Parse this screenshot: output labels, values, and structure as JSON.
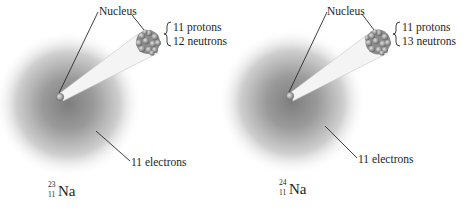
{
  "figure": {
    "atoms": [
      {
        "nucleus_label": "Nucleus",
        "protons": "11 protons",
        "neutrons": "12 neutrons",
        "electrons": "11 electrons",
        "isotope": {
          "mass_number": "23",
          "atomic_number": "11",
          "symbol": "Na"
        }
      },
      {
        "nucleus_label": "Nucleus",
        "protons": "11 protons",
        "neutrons": "13 neutrons",
        "electrons": "11 electrons",
        "isotope": {
          "mass_number": "24",
          "atomic_number": "11",
          "symbol": "Na"
        }
      }
    ],
    "colors": {
      "cloud_center": "#8a8a8a",
      "cloud_edge": "#ffffff",
      "nucleus": "#9a9a9a",
      "leader_line": "#2a2a2a",
      "text": "#1e1e1e"
    }
  }
}
